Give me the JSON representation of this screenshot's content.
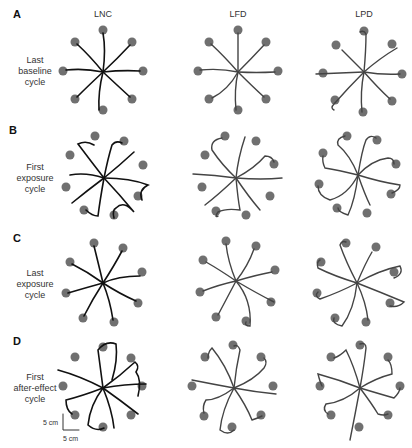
{
  "figure": {
    "columns": [
      "LNC",
      "LFD",
      "LPD"
    ],
    "rows": [
      {
        "letter": "A",
        "label_lines": [
          "Last",
          "baseline",
          "cycle"
        ]
      },
      {
        "letter": "B",
        "label_lines": [
          "First",
          "exposure",
          "cycle"
        ]
      },
      {
        "letter": "C",
        "label_lines": [
          "Last",
          "exposure",
          "cycle"
        ]
      },
      {
        "letter": "D",
        "label_lines": [
          "First",
          "after-effect",
          "cycle"
        ]
      }
    ],
    "scale_bar": {
      "vertical": "5 cm",
      "horizontal": "5 cm"
    },
    "colors": {
      "target": "#707070",
      "trajectory_lnc": "#111111",
      "trajectory_other": "#444444"
    }
  }
}
